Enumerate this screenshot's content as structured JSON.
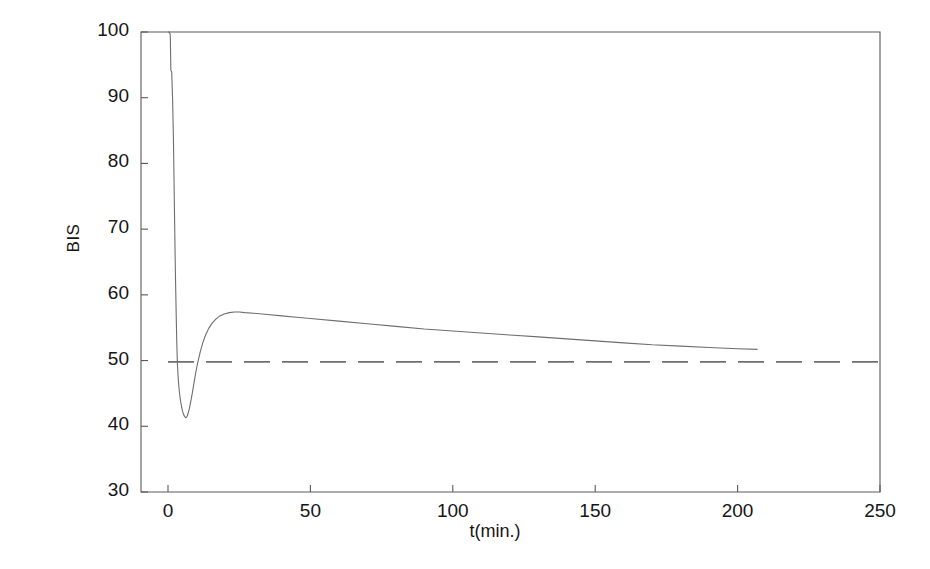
{
  "figure": {
    "background_color": "#ffffff",
    "line_color": "#6e6e6e",
    "axis_color": "#5a5a5a",
    "text_color": "#151515"
  },
  "chart_data": {
    "type": "line",
    "title": "",
    "xlabel": "t(min.)",
    "ylabel": "BIS",
    "xlim": [
      0,
      250
    ],
    "ylim": [
      30,
      100
    ],
    "xticks": [
      0,
      50,
      100,
      150,
      200,
      250
    ],
    "yticks": [
      30,
      40,
      50,
      60,
      70,
      80,
      90,
      100
    ],
    "grid": false,
    "legend": null,
    "series": [
      {
        "name": "BIS response",
        "style": "solid",
        "color": "#6e6e6e",
        "x": [
          0,
          0.4,
          0.8,
          1.0,
          1.3,
          1.6,
          1.9,
          2.1,
          2.3,
          2.5,
          2.7,
          2.9,
          3.1,
          3.3,
          3.6,
          3.9,
          4.2,
          4.5,
          4.8,
          5.1,
          5.4,
          5.8,
          6.2,
          6.6,
          7.0,
          7.5,
          8.0,
          8.6,
          9.2,
          9.8,
          10.5,
          11.3,
          12.2,
          13.2,
          14.3,
          15.5,
          16.8,
          18.2,
          19.8,
          21.5,
          23.4,
          25.0,
          27.0,
          30.0,
          35.0,
          40.0,
          45.0,
          50.0,
          60.0,
          70.0,
          80.0,
          90.0,
          100.0,
          110.0,
          120.0,
          130.0,
          140.0,
          150.0,
          160.0,
          170.0,
          180.0,
          190.0,
          200.0,
          207.0
        ],
        "y": [
          100.0,
          100.0,
          99.6,
          94.2,
          93.9,
          90.0,
          84.0,
          78.0,
          72.0,
          66.0,
          61.0,
          56.5,
          52.5,
          49.5,
          47.2,
          45.6,
          44.5,
          43.6,
          42.9,
          42.3,
          41.9,
          41.5,
          41.3,
          41.4,
          41.9,
          42.7,
          43.8,
          45.2,
          46.8,
          48.3,
          49.8,
          51.3,
          52.7,
          53.9,
          54.9,
          55.7,
          56.3,
          56.8,
          57.1,
          57.3,
          57.4,
          57.4,
          57.3,
          57.2,
          57.0,
          56.8,
          56.6,
          56.4,
          56.0,
          55.6,
          55.2,
          54.8,
          54.5,
          54.2,
          53.9,
          53.6,
          53.3,
          53.0,
          52.7,
          52.4,
          52.2,
          52.0,
          51.8,
          51.7
        ]
      },
      {
        "name": "setpoint",
        "style": "dashed",
        "color": "#6e6e6e",
        "x": [
          0,
          250
        ],
        "y": [
          49.8,
          49.8
        ]
      }
    ]
  }
}
